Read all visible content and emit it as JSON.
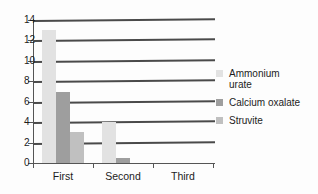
{
  "chart_data": {
    "type": "bar",
    "title": "",
    "subtitle": "",
    "xlabel": "",
    "ylabel": "",
    "categories": [
      "First",
      "Second",
      "Third"
    ],
    "series": [
      {
        "name": "Ammonium urate",
        "values": [
          13,
          4,
          0
        ],
        "color": "#e2e2e2"
      },
      {
        "name": "Calcium oxalate",
        "values": [
          7,
          0.5,
          0
        ],
        "color": "#9e9e9e"
      },
      {
        "name": "Struvite",
        "values": [
          3,
          0,
          0
        ],
        "color": "#c0c0c0"
      }
    ],
    "ylim": [
      0,
      14
    ],
    "yticks": [
      0,
      2,
      4,
      6,
      8,
      10,
      12,
      14
    ],
    "ytick_labels": [
      "0",
      "2",
      "4",
      "6",
      "8",
      "10",
      "12",
      "14"
    ],
    "grid": true,
    "grid_axis": "y",
    "legend_position": "right"
  },
  "legend": {
    "items": [
      {
        "label": "Ammonium\nurate",
        "color": "#e2e2e2"
      },
      {
        "label": "Calcium oxalate",
        "color": "#9e9e9e"
      },
      {
        "label": "Struvite",
        "color": "#c0c0c0"
      }
    ]
  },
  "axes": {
    "y_tick_labels": [
      "14",
      "12",
      "10",
      "8",
      "6",
      "4",
      "2",
      "0"
    ],
    "x_tick_labels": [
      "First",
      "Second",
      "Third"
    ]
  }
}
